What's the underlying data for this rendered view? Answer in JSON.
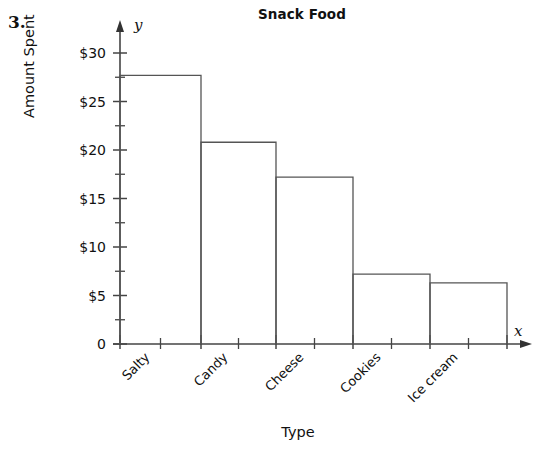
{
  "worksheet": {
    "number": "3."
  },
  "chart_data": {
    "type": "bar",
    "title": "Snack Food",
    "xlabel": "Type",
    "ylabel": "Amount Spent",
    "x_axis_variable": "x",
    "y_axis_variable": "y",
    "categories": [
      "Salty",
      "Candy",
      "Cheese",
      "Cookies",
      "Ice cream"
    ],
    "values": [
      27.7,
      20.8,
      17.2,
      7.2,
      6.3
    ],
    "ylim": [
      0,
      31
    ],
    "ytick_labels": [
      "0",
      "$5",
      "$10",
      "$15",
      "$20",
      "$25",
      "$30"
    ],
    "ytick_values": [
      0,
      5,
      10,
      15,
      20,
      25,
      30
    ],
    "minor_tick_interval": 2.5,
    "grid": false,
    "legend": false,
    "bar_style": "adjacent-outline",
    "bar_fill_color": "#ffffff",
    "bar_stroke_color": "#555555",
    "axis_color": "#444444"
  }
}
